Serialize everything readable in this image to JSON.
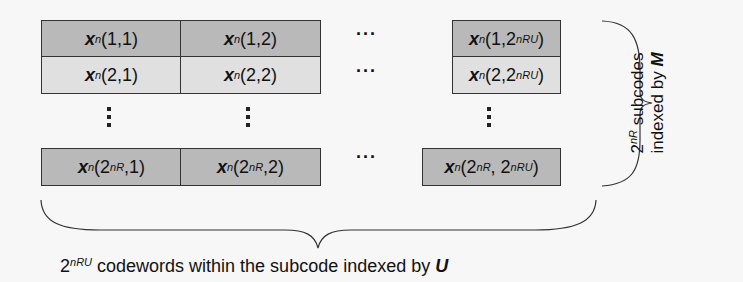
{
  "diagram": {
    "type": "codebook-table",
    "colors": {
      "dark_row": "#b9b9b9",
      "light_row": "#e0e0e0",
      "border": "#333333",
      "background": "#f7f7f7"
    },
    "symbol": "x",
    "superscript": "n",
    "rows": [
      {
        "shade": "dark",
        "cells": [
          {
            "args": "(1,1)"
          },
          {
            "args": "(1,2)"
          },
          {
            "ellipsis": "···"
          },
          {
            "args_pre": "(1,2",
            "sup": "nRU",
            "args_post": ")"
          }
        ]
      },
      {
        "shade": "light",
        "cells": [
          {
            "args": "(2,1)"
          },
          {
            "args": "(2,2)"
          },
          {
            "ellipsis": "···"
          },
          {
            "args_pre": "(2,2",
            "sup": "nRU",
            "args_post": ")"
          }
        ]
      },
      {
        "shade": "dark",
        "cells": [
          {
            "args_pre": "(2",
            "sup": "nR",
            "args_post": ",1)"
          },
          {
            "args_pre": "(2",
            "sup": "nR",
            "args_post": ",2)"
          },
          {
            "ellipsis": "···"
          },
          {
            "args_pre": "(2",
            "sup": "nR",
            "args_mid": ", 2",
            "sup2": "nRU",
            "args_post": ")"
          }
        ]
      }
    ],
    "right_label": {
      "line1_base": "2",
      "line1_sup": "nR",
      "line1_rest": " subcodes",
      "line2": "indexed by ",
      "line2_var": "M"
    },
    "bottom_label": {
      "base": "2",
      "sup": "nRU",
      "rest": " codewords within the subcode indexed by ",
      "var": "U"
    }
  }
}
